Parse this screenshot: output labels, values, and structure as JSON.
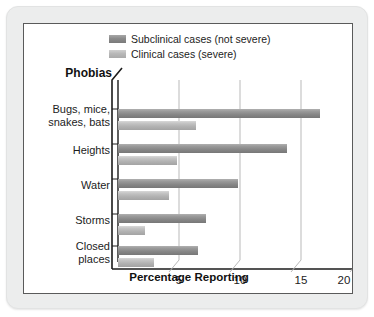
{
  "figure": {
    "legend": [
      {
        "label": "Subclinical cases (not severe)",
        "key": "subclinical",
        "color": "#8b8b8b"
      },
      {
        "label": "Clinical cases (severe)",
        "key": "clinical",
        "color": "#b8b8b8"
      }
    ],
    "y_axis_title": "Phobias",
    "x_axis_title": "Percentage Reporting"
  },
  "chart_data": {
    "type": "bar",
    "orientation": "horizontal",
    "title": "",
    "subtitle": "",
    "xlabel": "Percentage Reporting",
    "ylabel": "Phobias",
    "xlim": [
      0,
      21
    ],
    "xticks": [
      5,
      10,
      15,
      20
    ],
    "xtick_labels": [
      "5",
      "10",
      "15",
      "20"
    ],
    "grid": true,
    "grid_axis": "x",
    "legend_position": "top-right",
    "categories": [
      "Bugs, mice, snakes, bats",
      "Heights",
      "Water",
      "Storms",
      "Closed places"
    ],
    "category_label_lines": [
      [
        "Bugs, mice,",
        "snakes, bats"
      ],
      [
        "Heights"
      ],
      [
        "Water"
      ],
      [
        "Storms"
      ],
      [
        "Closed",
        "places"
      ]
    ],
    "series": [
      {
        "name": "Subclinical cases (not severe)",
        "color": "#8b8b8b",
        "values": [
          17.5,
          14.7,
          10.4,
          7.6,
          6.9
        ]
      },
      {
        "name": "Clinical cases (severe)",
        "color": "#b8b8b8",
        "values": [
          6.8,
          5.1,
          4.4,
          2.3,
          3.1
        ]
      }
    ]
  }
}
